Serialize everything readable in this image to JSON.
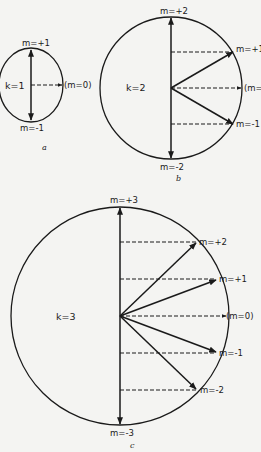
{
  "figure": {
    "background": "#f4f4f2",
    "ink": "#1a1a1a",
    "panels": [
      {
        "id": "a",
        "caption": "a",
        "k_label": "k=1",
        "labels": {
          "top": "m=+1",
          "bottom": "m=-1",
          "zero": "(m=0)"
        }
      },
      {
        "id": "b",
        "caption": "b",
        "k_label": "k=2",
        "labels": {
          "top": "m=+2",
          "p1": "m=+1",
          "zero": "(m=0)",
          "n1": "m=-1",
          "bottom": "m=-2"
        }
      },
      {
        "id": "c",
        "caption": "c",
        "k_label": "k=3",
        "labels": {
          "top": "m=+3",
          "p2": "m=+2",
          "p1": "m=+1",
          "zero": "(m=0)",
          "n1": "m=-1",
          "n2": "m=-2",
          "bottom": "m=-3"
        }
      }
    ]
  }
}
